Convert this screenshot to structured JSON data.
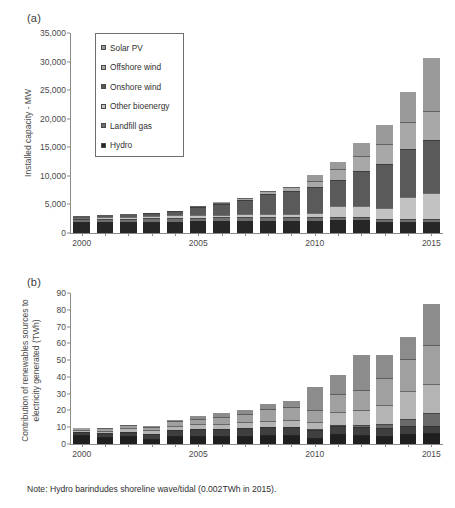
{
  "figure": {
    "note": "Note: Hydro barindudes shoreline wave/tidal (0.002TWh in 2015)."
  },
  "panel_a": {
    "label": "(a)",
    "ylabel": "Installed capacity - MW",
    "legend_title": "",
    "legend": [
      {
        "label": "Solar PV",
        "color": "#9a9a9a"
      },
      {
        "label": "Offshore wind",
        "color": "#a8a8a8"
      },
      {
        "label": "Onshore wind",
        "color": "#5a5a5a"
      },
      {
        "label": "Other bioenergy",
        "color": "#c2c2c2"
      },
      {
        "label": "Landfill gas",
        "color": "#6e6e6e"
      },
      {
        "label": "Hydro",
        "color": "#262626"
      }
    ]
  },
  "panel_b": {
    "label": "(b)",
    "ylabel": "Contribution of renewables sources to electricity generated (TWh)",
    "legend": [
      {
        "label": "Total Hydro",
        "color": "#1f1f1f"
      },
      {
        "label": "Landfill Gas",
        "color": "#3f3f3f"
      },
      {
        "label": "Other Bioenergy",
        "color": "#b4b4b4"
      },
      {
        "label": "Solar PV",
        "color": "#6a6a6a"
      },
      {
        "label": "Onshore Wind",
        "color": "#a0a0a0"
      },
      {
        "label": "Offshore Wind",
        "color": "#8c8c8c"
      }
    ]
  },
  "chart_data": [
    {
      "type": "bar",
      "stacked": true,
      "panel": "(a)",
      "title": "",
      "xlabel": "",
      "ylabel": "Installed capacity - MW",
      "ylim": [
        0,
        35000
      ],
      "yticks": [
        0,
        5000,
        10000,
        15000,
        20000,
        25000,
        30000,
        35000
      ],
      "ytick_labels": [
        "0",
        "5,000",
        "10,000",
        "15,000",
        "20,000",
        "25,000",
        "30,000",
        "35,000"
      ],
      "grid": false,
      "legend_position": "upper-left-inset",
      "categories": [
        2000,
        2001,
        2002,
        2003,
        2004,
        2005,
        2006,
        2007,
        2008,
        2009,
        2010,
        2011,
        2012,
        2013,
        2014,
        2015
      ],
      "xtick_labels": [
        "2000",
        "2005",
        "2010",
        "2015"
      ],
      "series": [
        {
          "name": "Hydro",
          "color": "#262626",
          "values": [
            1900,
            1950,
            1960,
            1980,
            2000,
            2020,
            2030,
            2050,
            2060,
            2080,
            2100,
            2250,
            2300,
            1900,
            1900,
            1900
          ]
        },
        {
          "name": "Landfill gas",
          "color": "#6e6e6e",
          "values": [
            480,
            530,
            560,
            600,
            640,
            680,
            700,
            720,
            740,
            760,
            770,
            600,
            580,
            560,
            540,
            520
          ]
        },
        {
          "name": "Other bioenergy",
          "color": "#c2c2c2",
          "values": [
            330,
            350,
            360,
            420,
            440,
            460,
            470,
            500,
            520,
            560,
            700,
            1950,
            1900,
            1850,
            3850,
            4600
          ]
        },
        {
          "name": "Onshore wind",
          "color": "#5a5a5a",
          "values": [
            310,
            350,
            380,
            500,
            700,
            1440,
            1830,
            2470,
            3540,
            3930,
            4420,
            4550,
            6100,
            7700,
            8450,
            9300
          ]
        },
        {
          "name": "Offshore wind",
          "color": "#a8a8a8",
          "values": [
            0,
            0,
            0,
            60,
            60,
            200,
            300,
            380,
            540,
            760,
            1150,
            1800,
            2600,
            3550,
            4650,
            5050
          ]
        },
        {
          "name": "Solar PV",
          "color": "#9a9a9a",
          "values": [
            0,
            0,
            0,
            0,
            0,
            10,
            15,
            20,
            25,
            30,
            1000,
            1350,
            2200,
            3300,
            5300,
            9200
          ]
        }
      ],
      "totals": [
        3020,
        3180,
        3260,
        3560,
        3840,
        4810,
        5345,
        6140,
        7425,
        8120,
        10140,
        12500,
        15680,
        18760,
        24690,
        30570
      ]
    },
    {
      "type": "bar",
      "stacked": true,
      "panel": "(b)",
      "title": "",
      "xlabel": "",
      "ylabel": "Contribution of renewables sources to electricity generated (TWh)",
      "ylim": [
        0,
        90
      ],
      "yticks": [
        0,
        10,
        20,
        30,
        40,
        50,
        60,
        70,
        80,
        90
      ],
      "ytick_labels": [
        "0",
        "10",
        "20",
        "30",
        "40",
        "50",
        "60",
        "70",
        "80",
        "90"
      ],
      "grid": false,
      "legend_position": "upper-left-inset",
      "categories": [
        2000,
        2001,
        2002,
        2003,
        2004,
        2005,
        2006,
        2007,
        2008,
        2009,
        2010,
        2011,
        2012,
        2013,
        2014,
        2015
      ],
      "xtick_labels": [
        "2000",
        "2005",
        "2010",
        "2015"
      ],
      "series": [
        {
          "name": "Total Hydro",
          "color": "#1f1f1f",
          "values": [
            5.1,
            4.1,
            4.8,
            3.2,
            4.8,
            4.9,
            4.5,
            5.0,
            5.1,
            5.2,
            3.6,
            5.7,
            5.3,
            4.7,
            5.9,
            6.3
          ]
        },
        {
          "name": "Landfill Gas",
          "color": "#3f3f3f",
          "values": [
            1.9,
            2.2,
            2.5,
            2.8,
            3.5,
            4.0,
            4.4,
            4.6,
            4.8,
            4.9,
            5.0,
            5.2,
            5.1,
            5.0,
            4.8,
            4.6
          ]
        },
        {
          "name": "Solar PV",
          "color": "#6a6a6a",
          "values": [
            0.0,
            0.0,
            0.0,
            0.0,
            0.0,
            0.0,
            0.0,
            0.0,
            0.0,
            0.0,
            0.1,
            0.2,
            1.2,
            2.0,
            4.0,
            7.6
          ]
        },
        {
          "name": "Other Bioenergy",
          "color": "#b4b4b4",
          "values": [
            1.6,
            1.7,
            2.2,
            2.3,
            2.7,
            2.9,
            3.2,
            3.4,
            3.6,
            4.4,
            4.6,
            8.0,
            8.6,
            11.4,
            17.1,
            17.4
          ]
        },
        {
          "name": "Onshore Wind",
          "color": "#a0a0a0",
          "values": [
            0.9,
            1.3,
            1.7,
            2.0,
            2.8,
            3.3,
            4.2,
            5.0,
            7.1,
            7.6,
            7.2,
            10.5,
            12.0,
            16.3,
            18.6,
            22.9
          ]
        },
        {
          "name": "Offshore Wind",
          "color": "#8c8c8c",
          "values": [
            0.0,
            0.1,
            0.2,
            0.3,
            0.3,
            1.6,
            2.0,
            2.3,
            3.1,
            3.4,
            13.6,
            11.5,
            20.6,
            13.8,
            13.5,
            24.5
          ]
        }
      ],
      "totals": [
        9.5,
        9.4,
        11.4,
        10.6,
        14.1,
        16.7,
        18.3,
        20.3,
        23.7,
        25.5,
        34.1,
        41.1,
        52.8,
        53.2,
        63.9,
        83.3
      ]
    }
  ]
}
